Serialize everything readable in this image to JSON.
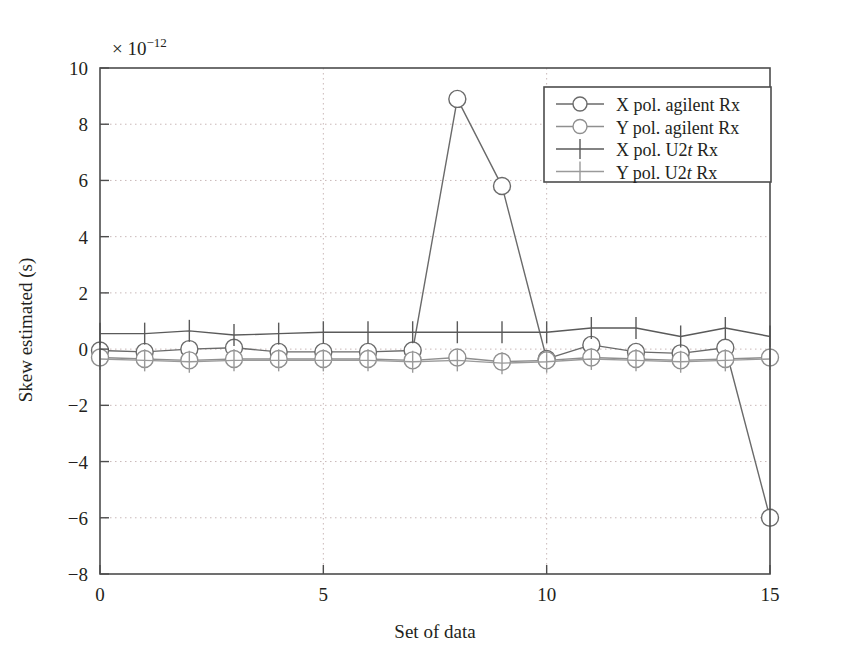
{
  "chart_data": {
    "type": "line",
    "title": "",
    "subtitle": "",
    "xlabel": "Set of data",
    "ylabel": "Skew estimated (s)",
    "y_exponent_label": "× 10",
    "y_exponent_power": "−12",
    "y_scale": 1e-12,
    "xlim": [
      0,
      15
    ],
    "ylim": [
      -8,
      10
    ],
    "xticks": [
      0,
      5,
      10,
      15
    ],
    "xticklabels": [
      "0",
      "5",
      "10",
      "15"
    ],
    "x_minor_ticks": [
      1,
      2,
      3,
      4,
      6,
      7,
      8,
      9,
      11,
      12,
      13,
      14
    ],
    "yticks": [
      -8,
      -6,
      -4,
      -2,
      0,
      2,
      4,
      6,
      8,
      10
    ],
    "yticklabels": [
      "−8",
      "−6",
      "−4",
      "−2",
      "0",
      "2",
      "4",
      "6",
      "8",
      "10"
    ],
    "grid": "dotted-horizontal-and-vertical",
    "grid_color": "#c9b8b8",
    "legend_position": "upper right",
    "x": [
      0,
      1,
      2,
      3,
      4,
      5,
      6,
      7,
      8,
      9,
      10,
      11,
      12,
      13,
      14,
      15
    ],
    "series": [
      {
        "name": "X pol. agilent Rx",
        "marker": "circle",
        "color": "#6a6a6a",
        "values": [
          -0.05,
          -0.1,
          0.0,
          0.05,
          -0.1,
          -0.1,
          -0.1,
          -0.05,
          8.9,
          5.8,
          -0.35,
          0.15,
          -0.1,
          -0.15,
          0.05,
          -6.0
        ]
      },
      {
        "name": "Y pol. agilent Rx",
        "marker": "circle",
        "color": "#8f8f8f",
        "values": [
          -0.3,
          -0.35,
          -0.4,
          -0.35,
          -0.35,
          -0.35,
          -0.35,
          -0.4,
          -0.3,
          -0.45,
          -0.4,
          -0.3,
          -0.35,
          -0.4,
          -0.35,
          -0.3
        ]
      },
      {
        "name": "X pol. U2t Rx",
        "marker": "plus",
        "color": "#5a5a5a",
        "values": [
          0.55,
          0.55,
          0.65,
          0.5,
          0.55,
          0.6,
          0.6,
          0.6,
          0.6,
          0.6,
          0.6,
          0.75,
          0.75,
          0.45,
          0.75,
          0.45
        ]
      },
      {
        "name": "Y pol. U2t Rx",
        "marker": "plus",
        "color": "#9a9a9a",
        "values": [
          -0.35,
          -0.4,
          -0.45,
          -0.4,
          -0.4,
          -0.4,
          -0.4,
          -0.45,
          -0.4,
          -0.5,
          -0.45,
          -0.35,
          -0.4,
          -0.45,
          -0.4,
          -0.35
        ]
      }
    ]
  },
  "legend": {
    "entries": [
      {
        "label_pre": "X pol. agilent Rx",
        "label_ital": "",
        "label_post": "",
        "marker": "circle"
      },
      {
        "label_pre": "Y pol. agilent Rx",
        "label_ital": "",
        "label_post": "",
        "marker": "circle"
      },
      {
        "label_pre": "X pol. U2",
        "label_ital": "t",
        "label_post": " Rx",
        "marker": "plus"
      },
      {
        "label_pre": "Y pol. U2",
        "label_ital": "t",
        "label_post": " Rx",
        "marker": "plus"
      }
    ]
  },
  "axes": {
    "frame_color": "#4d4d4d"
  }
}
